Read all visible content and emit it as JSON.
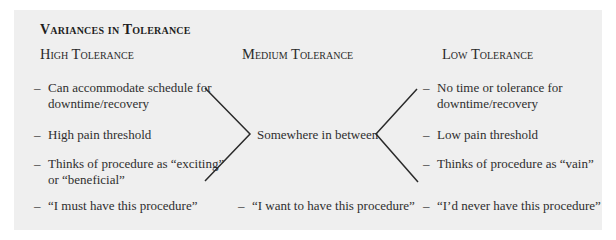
{
  "title": "Variances in Tolerance",
  "columns": {
    "high": {
      "heading": "High Tolerance",
      "items": [
        {
          "line1": "Can accommodate schedule for",
          "line2": "downtime/recovery"
        },
        {
          "line1": "High pain threshold"
        },
        {
          "line1": "Thinks of procedure as “exciting”",
          "line2": "or “beneficial”"
        }
      ],
      "statement": "“I must have this procedure”"
    },
    "medium": {
      "heading": "Medium Tolerance",
      "center_text": "Somewhere in between",
      "statement": "“I want to have this procedure”"
    },
    "low": {
      "heading": "Low Tolerance",
      "items": [
        {
          "line1": "No time or tolerance for",
          "line2": "downtime/recovery"
        },
        {
          "line1": "Low pain threshold"
        },
        {
          "line1": "Thinks of procedure as “vain”"
        }
      ],
      "statement": "“I’d never have this procedure”"
    }
  },
  "dash": "–",
  "colors": {
    "panel_bg": "#efefef",
    "text": "#2a2a2a",
    "line": "#2a2a2a"
  }
}
